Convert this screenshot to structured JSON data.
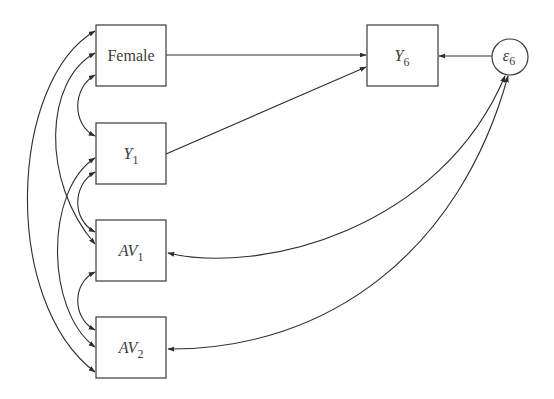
{
  "diagram": {
    "type": "path-diagram",
    "nodes": {
      "female": {
        "label": "Female",
        "shape": "box"
      },
      "y1": {
        "label": "Y",
        "subscript": "1",
        "shape": "box"
      },
      "av1": {
        "label": "AV",
        "subscript": "1",
        "shape": "box"
      },
      "av2": {
        "label": "AV",
        "subscript": "2",
        "shape": "box"
      },
      "y6": {
        "label": "Y",
        "subscript": "6",
        "shape": "box"
      },
      "e6": {
        "label": "ε",
        "subscript": "6",
        "shape": "circle"
      }
    },
    "directed_edges": [
      {
        "from": "Female",
        "to": "Y6"
      },
      {
        "from": "Y1",
        "to": "Y6"
      },
      {
        "from": "ε6",
        "to": "Y6"
      }
    ],
    "covariances": [
      {
        "a": "Female",
        "b": "Y1"
      },
      {
        "a": "Female",
        "b": "AV1"
      },
      {
        "a": "Female",
        "b": "AV2"
      },
      {
        "a": "Y1",
        "b": "AV1"
      },
      {
        "a": "Y1",
        "b": "AV2"
      },
      {
        "a": "AV1",
        "b": "AV2"
      },
      {
        "a": "AV1",
        "b": "ε6"
      },
      {
        "a": "AV2",
        "b": "ε6"
      }
    ],
    "colors": {
      "stroke": "#2e2e2e",
      "text": "#3c3c3c",
      "background": "#ffffff"
    }
  }
}
